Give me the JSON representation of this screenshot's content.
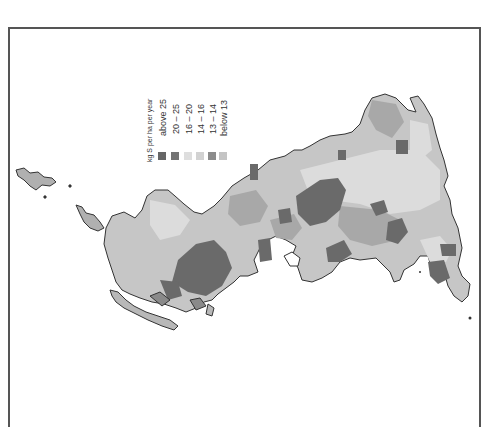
{
  "figure": {
    "type": "choropleth-map",
    "orientation": "rotated 90 degrees",
    "frame_color": "#555555"
  },
  "legend": {
    "title": "kg S per ha per year",
    "items": [
      {
        "label": "above 25",
        "color": "#666666"
      },
      {
        "label": "20 – 25",
        "color": "#747474"
      },
      {
        "label": "16 – 20",
        "color": "#dedede"
      },
      {
        "label": "14 – 16",
        "color": "#d2d2d2"
      },
      {
        "label": "13 – 14",
        "color": "#8c8c8c"
      },
      {
        "label": "below 13",
        "color": "#c4c4c4"
      }
    ]
  },
  "map_colors": {
    "coast": "#333333",
    "land_base": "#c8c8c8",
    "land_light": "#dcdcdc",
    "land_mid": "#a8a8a8",
    "land_dark": "#6a6a6a"
  }
}
